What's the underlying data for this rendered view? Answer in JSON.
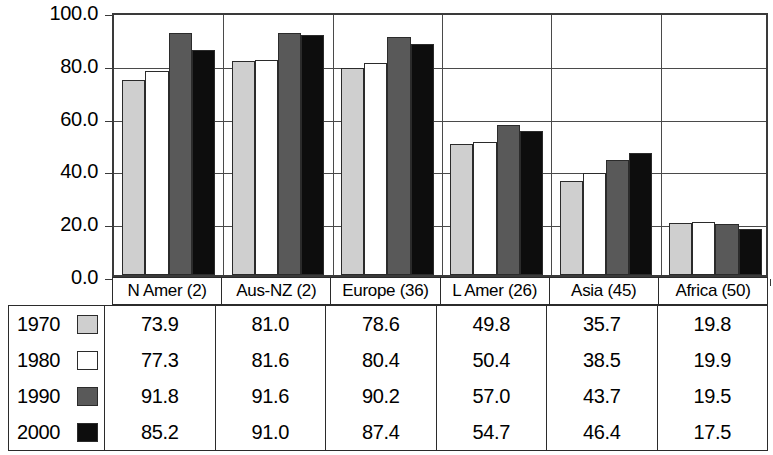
{
  "chart_data": {
    "type": "bar",
    "title": "",
    "subtitle": "",
    "xlabel": "",
    "ylabel": "",
    "ylim": [
      0,
      100
    ],
    "ytick_labels": [
      "100.0",
      "80.0",
      "60.0",
      "40.0",
      "20.0",
      "0.0"
    ],
    "ytick_values": [
      100,
      80,
      60,
      40,
      20,
      0
    ],
    "grid": true,
    "legend_position": "table-left",
    "categories": [
      "N Amer (2)",
      "Aus-NZ (2)",
      "Europe (36)",
      "L Amer (26)",
      "Asia (45)",
      "Africa (50)"
    ],
    "series": [
      {
        "name": "1970",
        "color": "#cfcfcf",
        "values": [
          73.9,
          81.0,
          78.6,
          49.8,
          35.7,
          19.8
        ]
      },
      {
        "name": "1980",
        "color": "#ffffff",
        "values": [
          77.3,
          81.6,
          80.4,
          50.4,
          38.5,
          19.9
        ]
      },
      {
        "name": "1990",
        "color": "#595959",
        "values": [
          91.8,
          91.6,
          90.2,
          57.0,
          43.7,
          19.5
        ]
      },
      {
        "name": "2000",
        "color": "#0d0d0d",
        "values": [
          85.2,
          91.0,
          87.4,
          54.7,
          46.4,
          17.5
        ]
      }
    ]
  },
  "table": {
    "column_headers": [
      "N Amer (2)",
      "Aus-NZ (2)",
      "Europe (36)",
      "L Amer (26)",
      "Asia (45)",
      "Africa (50)"
    ],
    "rows": [
      {
        "label": "1970",
        "swatch_color": "#cfcfcf",
        "values": [
          "73.9",
          "81.0",
          "78.6",
          "49.8",
          "35.7",
          "19.8"
        ]
      },
      {
        "label": "1980",
        "swatch_color": "#ffffff",
        "values": [
          "77.3",
          "81.6",
          "80.4",
          "50.4",
          "38.5",
          "19.9"
        ]
      },
      {
        "label": "1990",
        "swatch_color": "#595959",
        "values": [
          "91.8",
          "91.6",
          "90.2",
          "57.0",
          "43.7",
          "19.5"
        ]
      },
      {
        "label": "2000",
        "swatch_color": "#0d0d0d",
        "values": [
          "85.2",
          "91.0",
          "87.4",
          "54.7",
          "46.4",
          "17.5"
        ]
      }
    ]
  },
  "colors": {
    "axis": "#3a3a3a",
    "grid": "#4a4a4a",
    "border": "#2b2b2b",
    "background": "#ffffff"
  }
}
